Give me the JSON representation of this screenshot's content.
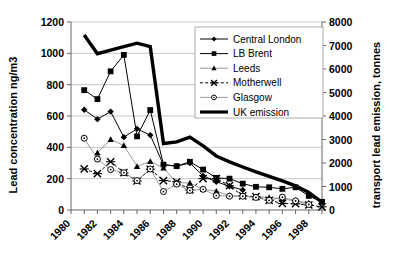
{
  "chart_data": {
    "type": "line",
    "title": "",
    "xlabel": "",
    "ylabel": "Lead concentration ng/m3",
    "y2label": "transport lead emission, tonnes",
    "grid": true,
    "legend_position": "upper-right",
    "x": [
      1980,
      1981,
      1982,
      1983,
      1984,
      1985,
      1986,
      1987,
      1988,
      1989,
      1990,
      1991,
      1992,
      1993,
      1994,
      1995,
      1996,
      1997,
      1998,
      1999
    ],
    "xtick_labels": [
      "1980",
      "1982",
      "1984",
      "1986",
      "1988",
      "1990",
      "1992",
      "1994",
      "1996",
      "1998"
    ],
    "xlim": [
      1980,
      1999
    ],
    "ylim": [
      0,
      1200
    ],
    "ytick_labels": [
      "0",
      "200",
      "400",
      "600",
      "800",
      "1000",
      "1200"
    ],
    "y2lim": [
      0,
      8000
    ],
    "y2tick_labels": [
      "0",
      "1000",
      "2000",
      "3000",
      "4000",
      "5000",
      "6000",
      "7000",
      "8000"
    ],
    "series": [
      {
        "name": "Central London",
        "axis": "left",
        "marker": "diamond",
        "color": "#000000",
        "x": [
          1981,
          1982,
          1983,
          1984,
          1985,
          1986,
          1987,
          1988,
          1989,
          1990,
          1991,
          1992,
          1993
        ],
        "values": [
          640,
          580,
          628,
          465,
          518,
          478,
          288,
          280,
          300,
          218,
          180,
          152,
          128
        ]
      },
      {
        "name": "LB Brent",
        "axis": "left",
        "marker": "square",
        "color": "#000000",
        "x": [
          1981,
          1982,
          1983,
          1984,
          1985,
          1986,
          1987,
          1988,
          1989,
          1990,
          1991,
          1992,
          1993,
          1994,
          1995,
          1996,
          1997,
          1998,
          1999
        ],
        "values": [
          765,
          708,
          885,
          990,
          470,
          638,
          290,
          280,
          308,
          258,
          205,
          200,
          168,
          148,
          145,
          135,
          145,
          90,
          52
        ]
      },
      {
        "name": "Leeds",
        "axis": "left",
        "marker": "triangle",
        "color": "#000000",
        "x": [
          1982,
          1983,
          1984,
          1985,
          1986,
          1987,
          1988,
          1989,
          1990,
          1991,
          1992,
          1993,
          1994,
          1995,
          1996,
          1997,
          1998
        ],
        "values": [
          365,
          450,
          412,
          278,
          310,
          268,
          175,
          172,
          132,
          120,
          92,
          88,
          85,
          80,
          70,
          58,
          45
        ]
      },
      {
        "name": "Motherwell",
        "axis": "left",
        "marker": "x",
        "color": "#000000",
        "dashed": true,
        "x": [
          1981,
          1982,
          1983,
          1984,
          1985,
          1986,
          1987,
          1988,
          1989,
          1990,
          1991,
          1992,
          1993,
          1994,
          1995,
          1996,
          1997,
          1998,
          1999
        ],
        "values": [
          262,
          232,
          308,
          238,
          185,
          260,
          188,
          180,
          128,
          200,
          200,
          155,
          90,
          85,
          62,
          42,
          40,
          32,
          20
        ]
      },
      {
        "name": "Glasgow",
        "axis": "left",
        "marker": "circle",
        "color": "#000000",
        "x": [
          1981,
          1982,
          1983,
          1984,
          1985,
          1986,
          1987,
          1988,
          1989,
          1990,
          1991,
          1992,
          1993,
          1994,
          1995,
          1996,
          1997,
          1998
        ],
        "values": [
          458,
          325,
          258,
          238,
          188,
          262,
          118,
          165,
          125,
          132,
          92,
          88,
          88,
          80,
          62,
          82,
          58,
          35
        ]
      },
      {
        "name": "UK emission",
        "axis": "right",
        "marker": "none",
        "color": "#000000",
        "thick": true,
        "x": [
          1981,
          1982,
          1983,
          1984,
          1985,
          1986,
          1987,
          1988,
          1989,
          1990,
          1991,
          1992,
          1993,
          1994,
          1995,
          1996,
          1997,
          1998,
          1999
        ],
        "values": [
          7450,
          6650,
          6800,
          6950,
          7100,
          6950,
          2830,
          2900,
          3100,
          2730,
          2300,
          2050,
          1830,
          1620,
          1430,
          1240,
          1030,
          750,
          330
        ]
      }
    ]
  },
  "legend": {
    "items": [
      {
        "label": "Central London"
      },
      {
        "label": "LB Brent"
      },
      {
        "label": "Leeds"
      },
      {
        "label": "Motherwell"
      },
      {
        "label": "Glasgow"
      },
      {
        "label": "UK emission"
      }
    ]
  }
}
